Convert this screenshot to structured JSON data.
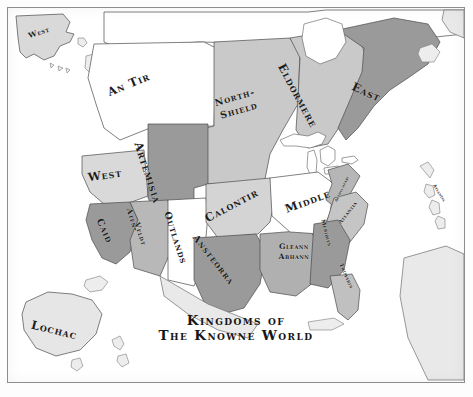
{
  "map": {
    "title_line_1": "Kingdoms of",
    "title_line_2": "The Knowne World",
    "palette": {
      "background": "#ffffff",
      "frame_border": "#8d8d8d",
      "light_gray": "#c9c9c9",
      "mid_gray": "#b0b0b0",
      "dark_gray": "#9a9a9a",
      "white_region": "#ffffff",
      "landmass_gray": "#e9e9e9",
      "outline": "#4a4a4a",
      "label_color": "#1d1d1d"
    },
    "kingdoms": [
      {
        "id": "west-alaska",
        "label": "West",
        "size": "sm",
        "x": 38,
        "y": 32,
        "rotate": -18,
        "fill": "#d9d9d9"
      },
      {
        "id": "an-tir",
        "label": "An Tir",
        "size": "lg",
        "x": 128,
        "y": 84,
        "rotate": -22,
        "fill": "#ffffff"
      },
      {
        "id": "north-shield-1",
        "label": "North-",
        "size": "md",
        "x": 234,
        "y": 97,
        "rotate": -16,
        "fill": "#c9c9c9"
      },
      {
        "id": "north-shield-2",
        "label": "Shield",
        "size": "md",
        "x": 238,
        "y": 110,
        "rotate": -16,
        "fill": "#c9c9c9"
      },
      {
        "id": "eldormere",
        "label": "Eldormere",
        "size": "lg",
        "x": 296,
        "y": 95,
        "rotate": 62,
        "fill": "#c9c9c9"
      },
      {
        "id": "east",
        "label": "East",
        "size": "lg",
        "x": 365,
        "y": 92,
        "rotate": 24,
        "fill": "#9a9a9a"
      },
      {
        "id": "artemisia",
        "label": "Artemisia",
        "size": "lg",
        "x": 146,
        "y": 172,
        "rotate": 72,
        "fill": "#9a9a9a"
      },
      {
        "id": "west",
        "label": "West",
        "size": "lg",
        "x": 104,
        "y": 175,
        "rotate": -8,
        "fill": "#d9d9d9"
      },
      {
        "id": "caid",
        "label": "Caid",
        "size": "md",
        "x": 103,
        "y": 230,
        "rotate": 66,
        "fill": "#9a9a9a"
      },
      {
        "id": "atenveldt-1",
        "label": "Aten-",
        "size": "sm",
        "x": 131,
        "y": 219,
        "rotate": 72,
        "fill": "#b8b8b8"
      },
      {
        "id": "atenveldt-2",
        "label": "Veldt",
        "size": "sm",
        "x": 139,
        "y": 233,
        "rotate": 72,
        "fill": "#b8b8b8"
      },
      {
        "id": "outlands",
        "label": "Outlands",
        "size": "md",
        "x": 174,
        "y": 237,
        "rotate": 72,
        "fill": "#ffffff"
      },
      {
        "id": "calontir",
        "label": "Calontir",
        "size": "lg",
        "x": 231,
        "y": 205,
        "rotate": -28,
        "fill": "#d4d4d4"
      },
      {
        "id": "ansteorra",
        "label": "Ansteorra",
        "size": "md",
        "x": 212,
        "y": 259,
        "rotate": 52,
        "fill": "#9a9a9a"
      },
      {
        "id": "gleann-1",
        "label": "Gleann",
        "size": "sm",
        "x": 293,
        "y": 246,
        "rotate": 0,
        "fill": "#b0b0b0"
      },
      {
        "id": "gleann-2",
        "label": "Abhann",
        "size": "sm",
        "x": 293,
        "y": 256,
        "rotate": 0,
        "fill": "#b0b0b0"
      },
      {
        "id": "middle",
        "label": "Middle",
        "size": "lg",
        "x": 307,
        "y": 201,
        "rotate": -20,
        "fill": "#ffffff"
      },
      {
        "id": "aethelmearc",
        "label": "Aethelmearc",
        "size": "xxs",
        "x": 341,
        "y": 188,
        "rotate": -64,
        "fill": "#b6b6b6"
      },
      {
        "id": "atlantia",
        "label": "Atlantia",
        "size": "xs",
        "x": 347,
        "y": 212,
        "rotate": -52,
        "fill": "#c5c5c5"
      },
      {
        "id": "meridies",
        "label": "Meridies",
        "size": "xs",
        "x": 325,
        "y": 232,
        "rotate": 76,
        "fill": "#9a9a9a"
      },
      {
        "id": "trimaris",
        "label": "Trimaris",
        "size": "xs",
        "x": 345,
        "y": 275,
        "rotate": 66,
        "fill": "#c0c0c0"
      },
      {
        "id": "caribbean",
        "label": "Atlantia",
        "size": "xxs",
        "x": 438,
        "y": 192,
        "rotate": 58,
        "fill": "#e4e4e4"
      },
      {
        "id": "lochac",
        "label": "Lochac",
        "size": "lg",
        "x": 53,
        "y": 330,
        "rotate": 14,
        "fill": "#e6e6e6"
      }
    ],
    "landmasses": [
      {
        "id": "alaska",
        "name": "alaska"
      },
      {
        "id": "canada-north",
        "name": "northern-canada"
      },
      {
        "id": "greenland",
        "name": "greenland"
      },
      {
        "id": "south-america",
        "name": "south-america"
      },
      {
        "id": "australia",
        "name": "australia"
      },
      {
        "id": "new-zealand",
        "name": "new-zealand"
      },
      {
        "id": "cuba",
        "name": "cuba"
      },
      {
        "id": "caribbean-arc",
        "name": "caribbean-islands"
      }
    ]
  }
}
